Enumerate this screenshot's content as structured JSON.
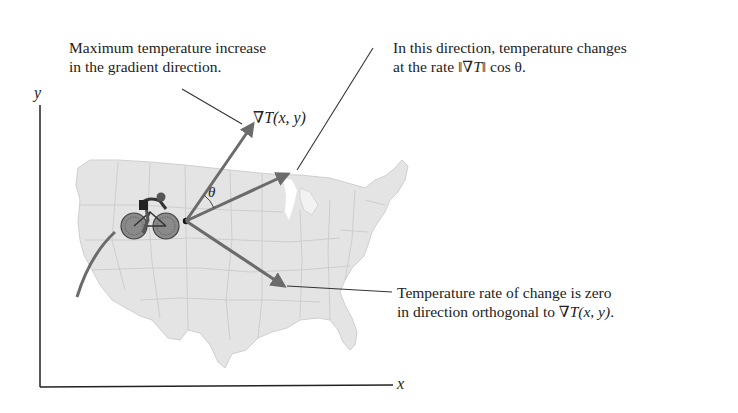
{
  "figure": {
    "type": "gradient-direction-diagram",
    "axes": {
      "x_label": "x",
      "y_label": "y"
    },
    "annotations": {
      "max_increase": {
        "line1": "Maximum temperature increase",
        "line2": "in the gradient direction."
      },
      "rate_direction": {
        "line1": "In this direction, temperature changes",
        "line2_prefix": "at the rate ",
        "line2_norm": "‖∇T‖",
        "line2_suffix": " cos θ."
      },
      "zero_rate": {
        "line1": "Temperature rate of change is zero",
        "line2_prefix": "in direction orthogonal to ",
        "line2_grad": "∇T(x, y)",
        "line2_suffix": "."
      }
    },
    "vector_labels": {
      "gradient": "∇T(x, y)",
      "angle": "θ"
    },
    "colors": {
      "map_fill": "#e4e4e4",
      "map_borders": "#c8c8c8",
      "arrow": "#6b6b6b",
      "leader_line": "#333333",
      "axis": "#222222",
      "text": "#222222"
    }
  }
}
